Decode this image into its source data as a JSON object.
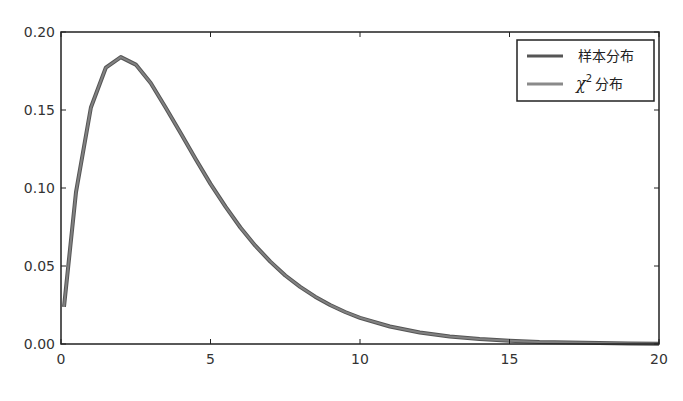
{
  "chart_data": {
    "type": "line",
    "title": "",
    "xlabel": "",
    "ylabel": "",
    "xlim": [
      0,
      20
    ],
    "ylim": [
      0,
      0.2
    ],
    "xticks": [
      0,
      5,
      10,
      15,
      20
    ],
    "xtick_labels": [
      "0",
      "5",
      "10",
      "15",
      "20"
    ],
    "yticks": [
      0.0,
      0.05,
      0.1,
      0.15,
      0.2
    ],
    "ytick_labels": [
      "0.00",
      "0.05",
      "0.10",
      "0.15",
      "0.20"
    ],
    "grid": false,
    "legend_position": "top-right",
    "x": [
      0.1,
      0.5,
      1,
      1.5,
      2,
      2.5,
      3,
      3.5,
      4,
      4.5,
      5,
      5.5,
      6,
      6.5,
      7,
      7.5,
      8,
      8.5,
      9,
      9.5,
      10,
      11,
      12,
      13,
      14,
      15,
      16,
      17,
      18,
      19,
      20
    ],
    "series": [
      {
        "name": "样本分布",
        "color": "#555555",
        "values": [
          0.0238,
          0.0974,
          0.1516,
          0.1771,
          0.1839,
          0.1791,
          0.1673,
          0.1516,
          0.1353,
          0.1186,
          0.1026,
          0.088,
          0.0747,
          0.063,
          0.0528,
          0.0439,
          0.0366,
          0.0303,
          0.025,
          0.0205,
          0.0168,
          0.0112,
          0.0074,
          0.0049,
          0.0032,
          0.0021,
          0.0013,
          0.0009,
          0.0006,
          0.0004,
          0.0002
        ]
      },
      {
        "name": "χ²分布",
        "color": "#8a8a8a",
        "values": [
          0.0238,
          0.0974,
          0.1516,
          0.1771,
          0.1839,
          0.1791,
          0.1673,
          0.1516,
          0.1353,
          0.1186,
          0.1026,
          0.088,
          0.0747,
          0.063,
          0.0528,
          0.0439,
          0.0366,
          0.0303,
          0.025,
          0.0205,
          0.0168,
          0.0112,
          0.0074,
          0.0049,
          0.0032,
          0.0021,
          0.0013,
          0.0009,
          0.0006,
          0.0004,
          0.0002
        ]
      }
    ]
  },
  "legend": {
    "items": [
      {
        "label": "样本分布",
        "color": "#555555"
      },
      {
        "label_symbol": "χ",
        "label_sup": "2",
        "label_rest": "分布",
        "color": "#8a8a8a"
      }
    ]
  }
}
